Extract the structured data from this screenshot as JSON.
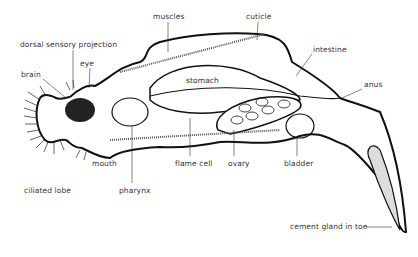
{
  "diagram": {
    "colors": {
      "line": "#111111",
      "background": "#ffffff",
      "label": "#333333"
    },
    "labels": [
      {
        "id": "muscles",
        "text": "muscles",
        "x": 153,
        "y": 17
      },
      {
        "id": "cuticle",
        "text": "cuticle",
        "x": 246,
        "y": 17
      },
      {
        "id": "dorsal-sensory-projection",
        "text": "dorsal sensory projection",
        "x": 20,
        "y": 45
      },
      {
        "id": "eye",
        "text": "eye",
        "x": 80,
        "y": 64
      },
      {
        "id": "intestine",
        "text": "intestine",
        "x": 313,
        "y": 50
      },
      {
        "id": "brain",
        "text": "brain",
        "x": 21,
        "y": 75
      },
      {
        "id": "stomach",
        "text": "stomach",
        "x": 186,
        "y": 81
      },
      {
        "id": "anus",
        "text": "anus",
        "x": 364,
        "y": 85
      },
      {
        "id": "mouth",
        "text": "mouth",
        "x": 92,
        "y": 160
      },
      {
        "id": "flame-cell",
        "text": "flame cell",
        "x": 175,
        "y": 160
      },
      {
        "id": "ovary",
        "text": "ovary",
        "x": 228,
        "y": 160
      },
      {
        "id": "bladder",
        "text": "bladder",
        "x": 284,
        "y": 160
      },
      {
        "id": "ciliated-lobe",
        "text": "ciliated lobe",
        "x": 24,
        "y": 187
      },
      {
        "id": "pharynx",
        "text": "pharynx",
        "x": 119,
        "y": 187
      },
      {
        "id": "cement-gland-in-toe",
        "text": "cement gland in toe",
        "x": 290,
        "y": 224
      }
    ]
  }
}
